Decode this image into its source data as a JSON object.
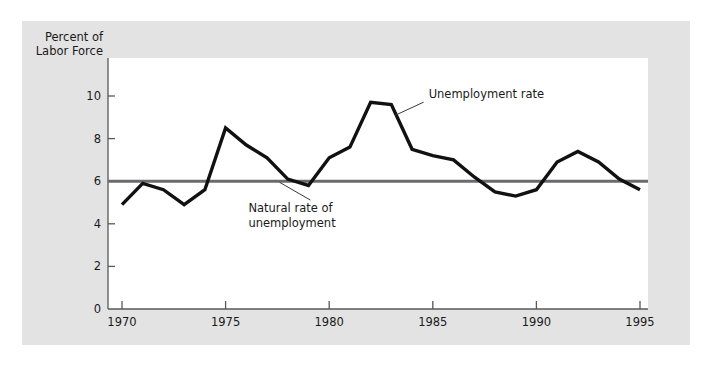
{
  "figure": {
    "background_color": "#ffffff",
    "panel_color": "#e3e3e3",
    "plot_color": "#ffffff"
  },
  "chart_data": {
    "type": "line",
    "title": "",
    "subtitle": "",
    "xlabel": "",
    "ylabel": "Percent of Labor Force",
    "ylabel_line1": "Percent of",
    "ylabel_line2": "Labor Force",
    "xlim": [
      1970,
      1995
    ],
    "ylim": [
      0,
      10.8
    ],
    "grid": false,
    "legend_position": "inline-annotations",
    "y_ticks": [
      0,
      2,
      4,
      6,
      8,
      10
    ],
    "y_tick_labels": [
      "0",
      "2",
      "4",
      "6",
      "8",
      "10"
    ],
    "x_ticks": [
      1970,
      1975,
      1980,
      1985,
      1990,
      1995
    ],
    "x_tick_labels": [
      "1970",
      "1975",
      "1980",
      "1985",
      "1990",
      "1995"
    ],
    "x": [
      1970,
      1971,
      1972,
      1973,
      1974,
      1975,
      1976,
      1977,
      1978,
      1979,
      1980,
      1981,
      1982,
      1983,
      1984,
      1985,
      1986,
      1987,
      1988,
      1989,
      1990,
      1991,
      1992,
      1993,
      1994,
      1995
    ],
    "series": [
      {
        "name": "Unemployment rate",
        "color": "#111111",
        "values": [
          4.9,
          5.9,
          5.6,
          4.9,
          5.6,
          8.5,
          7.7,
          7.1,
          6.1,
          5.8,
          7.1,
          7.6,
          9.7,
          9.6,
          7.5,
          7.2,
          7.0,
          6.2,
          5.5,
          5.3,
          5.6,
          6.9,
          7.4,
          6.9,
          6.1,
          5.6
        ]
      },
      {
        "name": "Natural rate of unemployment",
        "color": "#6b6b6e",
        "constant": 6.0,
        "values": [
          6.0,
          6.0,
          6.0,
          6.0,
          6.0,
          6.0,
          6.0,
          6.0,
          6.0,
          6.0,
          6.0,
          6.0,
          6.0,
          6.0,
          6.0,
          6.0,
          6.0,
          6.0,
          6.0,
          6.0,
          6.0,
          6.0,
          6.0,
          6.0,
          6.0,
          6.0
        ]
      }
    ],
    "annotations": [
      {
        "text": "Unemployment rate",
        "text_line1": "Unemployment rate",
        "text_line2": "",
        "anchor_x": 1983.2,
        "anchor_y": 9.1,
        "label_x": 1984.8,
        "label_y": 9.9
      },
      {
        "text": "Natural rate of unemployment",
        "text_line1": "Natural rate of",
        "text_line2": "unemployment",
        "anchor_x": 1977.6,
        "anchor_y": 5.95,
        "label_x": 1976.1,
        "label_y": 4.55
      }
    ]
  }
}
